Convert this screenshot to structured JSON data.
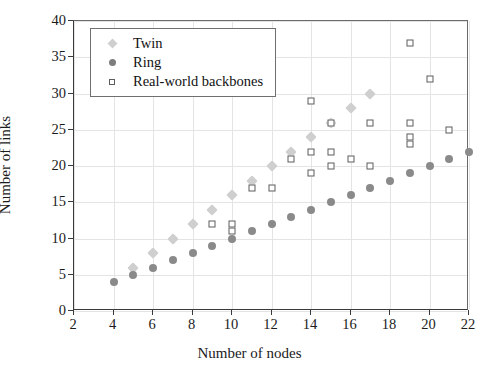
{
  "chart_data": {
    "type": "scatter",
    "title": "",
    "xlabel": "Number of nodes",
    "ylabel": "Number of links",
    "xlim": [
      2,
      22
    ],
    "ylim": [
      0,
      40
    ],
    "xticks": [
      2,
      4,
      6,
      8,
      10,
      12,
      14,
      16,
      18,
      20,
      22
    ],
    "xticklabels": [
      "2",
      "4",
      "6",
      "8",
      "10",
      "12",
      "14",
      "16",
      "18",
      "20",
      "22"
    ],
    "yticks": [
      0,
      5,
      10,
      15,
      20,
      25,
      30,
      35,
      40
    ],
    "yticklabels": [
      "0",
      "5",
      "10",
      "15",
      "20",
      "25",
      "30",
      "35",
      "40"
    ],
    "grid": true,
    "legend_position": "upper left",
    "series": [
      {
        "name": "Twin",
        "marker": "diamond",
        "color": "#cfcfcf",
        "points": [
          [
            5,
            6
          ],
          [
            6,
            8
          ],
          [
            7,
            10
          ],
          [
            8,
            12
          ],
          [
            9,
            14
          ],
          [
            10,
            16
          ],
          [
            11,
            18
          ],
          [
            12,
            20
          ],
          [
            13,
            22
          ],
          [
            14,
            24
          ],
          [
            15,
            26
          ],
          [
            16,
            28
          ],
          [
            17,
            30
          ]
        ]
      },
      {
        "name": "Ring",
        "marker": "circle",
        "color": "#8a8a8a",
        "points": [
          [
            4,
            4
          ],
          [
            5,
            5
          ],
          [
            6,
            6
          ],
          [
            7,
            7
          ],
          [
            8,
            8
          ],
          [
            9,
            9
          ],
          [
            10,
            10
          ],
          [
            11,
            11
          ],
          [
            12,
            12
          ],
          [
            13,
            13
          ],
          [
            14,
            14
          ],
          [
            15,
            15
          ],
          [
            16,
            16
          ],
          [
            17,
            17
          ],
          [
            18,
            18
          ],
          [
            19,
            19
          ],
          [
            20,
            20
          ],
          [
            21,
            21
          ],
          [
            22,
            22
          ]
        ]
      },
      {
        "name": "Real-world backbones",
        "marker": "open-square",
        "color": "#5c5c5c",
        "points": [
          [
            9,
            12
          ],
          [
            10,
            11
          ],
          [
            10,
            12
          ],
          [
            11,
            17
          ],
          [
            12,
            17
          ],
          [
            13,
            21
          ],
          [
            14,
            29
          ],
          [
            14,
            22
          ],
          [
            14,
            19
          ],
          [
            15,
            26
          ],
          [
            15,
            22
          ],
          [
            15,
            20
          ],
          [
            16,
            21
          ],
          [
            17,
            26
          ],
          [
            17,
            20
          ],
          [
            19,
            37
          ],
          [
            19,
            26
          ],
          [
            19,
            24
          ],
          [
            19,
            23
          ],
          [
            20,
            32
          ],
          [
            21,
            25
          ]
        ]
      }
    ]
  },
  "legend": {
    "items": [
      {
        "label": "Twin",
        "symbol": "diamond-icon"
      },
      {
        "label": "Ring",
        "symbol": "circle-icon"
      },
      {
        "label": "Real-world backbones",
        "symbol": "open-square-icon"
      }
    ]
  }
}
